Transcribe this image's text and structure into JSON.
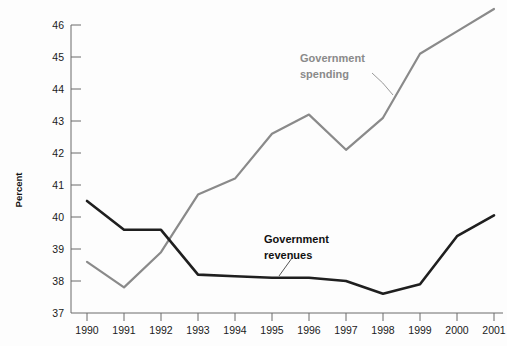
{
  "chart_data": {
    "type": "line",
    "title": "",
    "xlabel": "",
    "ylabel": "Percent",
    "categories": [
      "1990",
      "1991",
      "1992",
      "1993",
      "1994",
      "1995",
      "1996",
      "1997",
      "1998",
      "1999",
      "2000",
      "2001"
    ],
    "x": [
      1990,
      1991,
      1992,
      1993,
      1994,
      1995,
      1996,
      1997,
      1998,
      1999,
      2000,
      2001
    ],
    "xlim": [
      1990,
      2001
    ],
    "ylim": [
      37,
      46
    ],
    "yticks": [
      37,
      38,
      39,
      40,
      41,
      42,
      43,
      44,
      45,
      46
    ],
    "ytick_labels": [
      "37",
      "38",
      "39",
      "40",
      "41",
      "42",
      "43",
      "44",
      "45",
      "46"
    ],
    "grid": false,
    "legend": "inline-annotations",
    "series": [
      {
        "name": "Government spending",
        "color": "#8a8a8a",
        "values": [
          38.6,
          37.8,
          38.9,
          40.7,
          41.2,
          42.6,
          43.2,
          42.1,
          43.1,
          45.1,
          45.8,
          46.5
        ]
      },
      {
        "name": "Government revenues",
        "color": "#1f1f1f",
        "values": [
          40.5,
          39.6,
          39.6,
          38.2,
          38.15,
          38.1,
          38.1,
          38.0,
          37.6,
          37.9,
          39.4,
          40.05
        ]
      }
    ],
    "annotations": [
      {
        "text_line1": "Government",
        "text_line2": "spending",
        "color": "#8a8a8a"
      },
      {
        "text_line1": "Government",
        "text_line2": "revenues",
        "color": "#1f1f1f"
      }
    ]
  },
  "axis": {
    "y_axis_title": "Percent",
    "y_tick_labels": [
      "46",
      "45",
      "44",
      "43",
      "42",
      "41",
      "40",
      "39",
      "38",
      "37"
    ],
    "x_tick_labels": [
      "1990",
      "1991",
      "1992",
      "1993",
      "1994",
      "1995",
      "1996",
      "1997",
      "1998",
      "1999",
      "2000",
      "2001"
    ]
  },
  "labels": {
    "spending_line1": "Government",
    "spending_line2": "spending",
    "revenues_line1": "Government",
    "revenues_line2": "revenues"
  },
  "colors": {
    "spending": "#8a8a8a",
    "revenues": "#1f1f1f",
    "axis": "#6b6b6b",
    "background": "#fdfdfd"
  }
}
